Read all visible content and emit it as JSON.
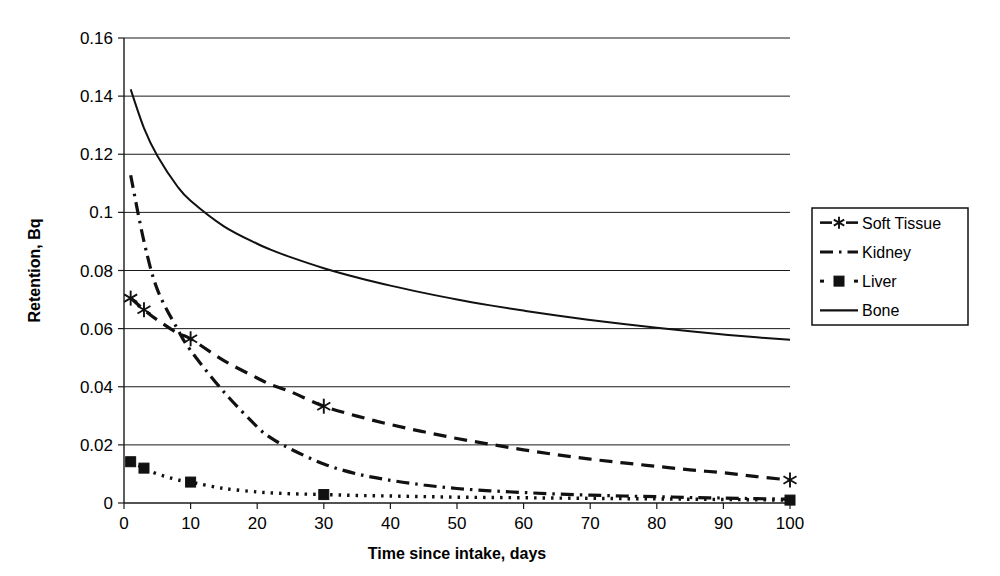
{
  "chart_data": {
    "type": "line",
    "title": "",
    "xlabel": "Time since intake, days",
    "ylabel": "Retention, Bq",
    "xlim": [
      0,
      100
    ],
    "ylim": [
      0,
      0.16
    ],
    "grid": "horizontal",
    "legend_position": "right",
    "xticks": [
      "0",
      "10",
      "20",
      "30",
      "40",
      "50",
      "60",
      "70",
      "80",
      "90",
      "100"
    ],
    "xtick_values": [
      0,
      10,
      20,
      30,
      40,
      50,
      60,
      70,
      80,
      90,
      100
    ],
    "yticks": [
      "0",
      "0.02",
      "0.04",
      "0.06",
      "0.08",
      "0.1",
      "0.12",
      "0.14",
      "0.16"
    ],
    "ytick_values": [
      0,
      0.02,
      0.04,
      0.06,
      0.08,
      0.1,
      0.12,
      0.14,
      0.16
    ],
    "x": [
      1,
      3,
      5,
      8,
      10,
      15,
      20,
      22,
      25,
      30,
      35,
      40,
      45,
      50,
      55,
      60,
      65,
      70,
      75,
      80,
      85,
      90,
      95,
      100
    ],
    "series": [
      {
        "name": "Soft Tissue",
        "style": "dashed",
        "marker": "asterisk",
        "marker_x": [
          1,
          3,
          10,
          30,
          100
        ],
        "marker_y": [
          0.0705,
          0.0665,
          0.0565,
          0.0333,
          0.0079
        ],
        "values": [
          0.0705,
          0.0665,
          0.063,
          0.0585,
          0.0565,
          0.049,
          0.043,
          0.0408,
          0.0383,
          0.0333,
          0.0299,
          0.027,
          0.0245,
          0.0222,
          0.0202,
          0.0183,
          0.0166,
          0.0151,
          0.0138,
          0.0126,
          0.0114,
          0.0104,
          0.0091,
          0.0079
        ]
      },
      {
        "name": "Kidney",
        "style": "dash-dot",
        "marker": "none",
        "marker_x": [],
        "marker_y": [],
        "values": [
          0.1128,
          0.09,
          0.0735,
          0.06,
          0.0525,
          0.0382,
          0.0262,
          0.0225,
          0.0186,
          0.0134,
          0.01,
          0.0078,
          0.0062,
          0.005,
          0.0042,
          0.0036,
          0.0031,
          0.0027,
          0.0024,
          0.0022,
          0.0019,
          0.0017,
          0.0015,
          0.0013
        ]
      },
      {
        "name": "Liver",
        "style": "dotted",
        "marker": "square",
        "marker_x": [
          1,
          3,
          10,
          30,
          100
        ],
        "marker_y": [
          0.0142,
          0.012,
          0.0072,
          0.0029,
          0.001
        ],
        "values": [
          0.0142,
          0.012,
          0.01,
          0.008,
          0.0072,
          0.005,
          0.0038,
          0.0035,
          0.0032,
          0.0029,
          0.0026,
          0.0024,
          0.0022,
          0.002,
          0.0019,
          0.0018,
          0.0017,
          0.0016,
          0.0015,
          0.0014,
          0.0013,
          0.0012,
          0.0011,
          0.001
        ]
      },
      {
        "name": "Bone",
        "style": "solid",
        "marker": "none",
        "marker_x": [],
        "marker_y": [],
        "values": [
          0.1423,
          0.129,
          0.1195,
          0.109,
          0.104,
          0.0952,
          0.0892,
          0.0872,
          0.0846,
          0.0808,
          0.0776,
          0.0748,
          0.0723,
          0.07,
          0.068,
          0.0662,
          0.0645,
          0.063,
          0.0616,
          0.0603,
          0.0591,
          0.058,
          0.057,
          0.0562
        ]
      }
    ],
    "legend_entries": [
      {
        "label": "Soft Tissue",
        "style": "dashed",
        "marker": "asterisk"
      },
      {
        "label": "Kidney",
        "style": "dash-dot",
        "marker": "none"
      },
      {
        "label": "Liver",
        "style": "dotted",
        "marker": "square"
      },
      {
        "label": "Bone",
        "style": "solid",
        "marker": "none"
      }
    ]
  },
  "colors": {
    "line": "#111111",
    "grid": "#1a1a1a",
    "background": "#ffffff",
    "text": "#000000"
  }
}
